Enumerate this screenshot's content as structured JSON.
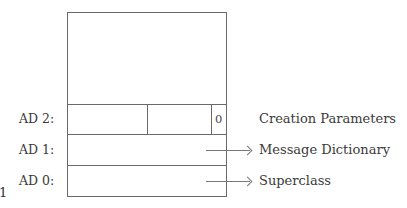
{
  "diagram": {
    "rows": [
      {
        "label": "AD 2:",
        "description": "Creation Parameters",
        "fields": [
          "",
          "",
          "0"
        ],
        "arrow": false
      },
      {
        "label": "AD 1:",
        "description": "Message Dictionary",
        "arrow": true
      },
      {
        "label": "AD 0:",
        "description": "Superclass",
        "arrow": true
      }
    ],
    "left_fragment": "1",
    "colors": {
      "line": "#6a6a6a",
      "text": "#3a3a3a",
      "background": "#ffffff"
    }
  }
}
